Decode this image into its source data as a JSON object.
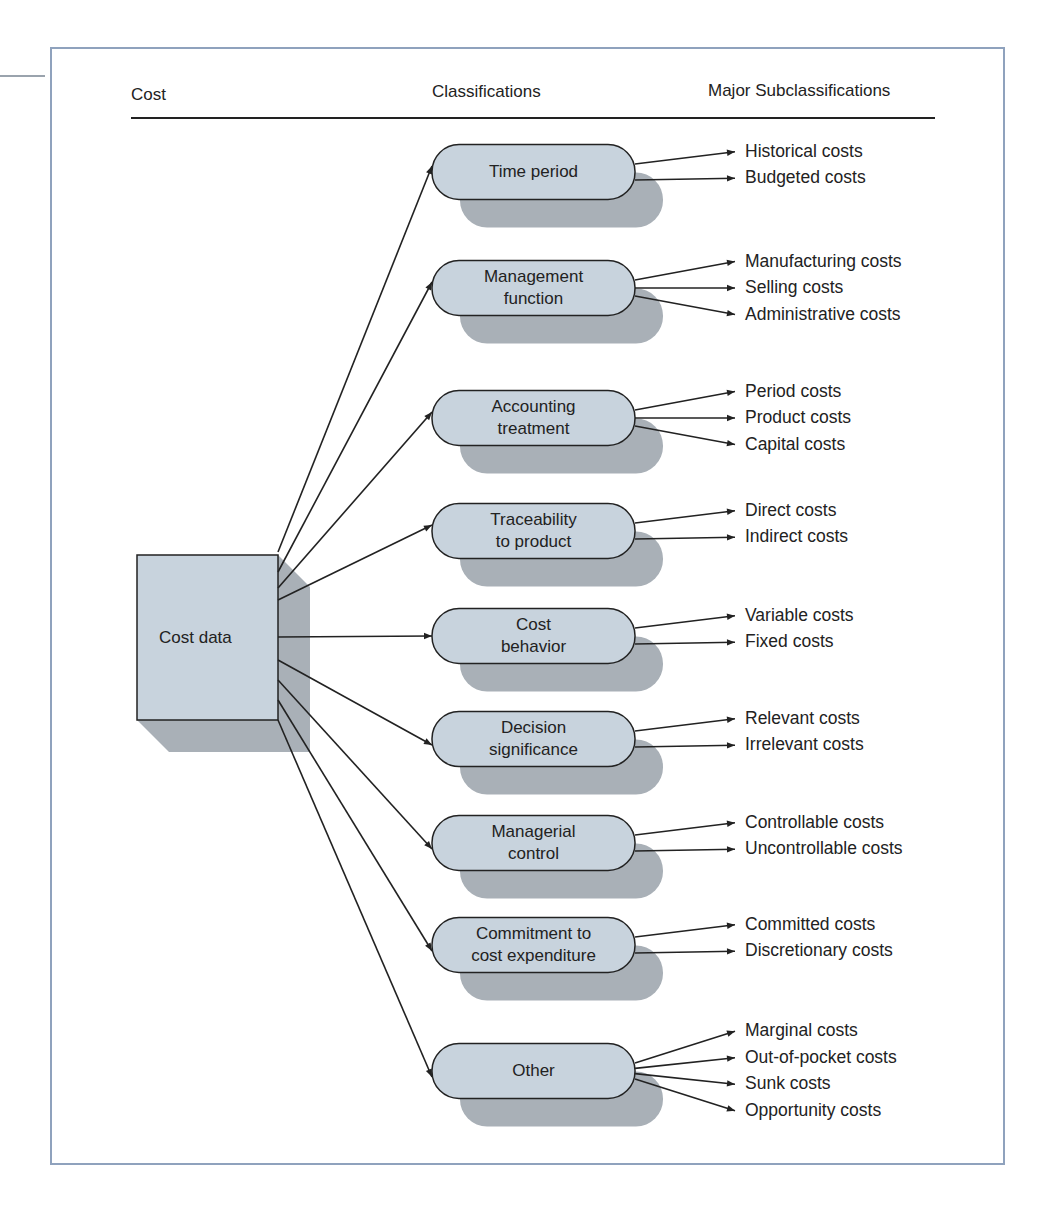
{
  "header": {
    "col_cost": "Cost",
    "col_classifications": "Classifications",
    "col_subclassifications": "Major Subclassifications"
  },
  "root": {
    "label": "Cost data"
  },
  "classifications": [
    {
      "label": "Time period",
      "subs": [
        "Historical costs",
        "Budgeted costs"
      ]
    },
    {
      "label": "Management function",
      "subs": [
        "Manufacturing costs",
        "Selling costs",
        "Administrative costs"
      ]
    },
    {
      "label": "Accounting treatment",
      "subs": [
        "Period costs",
        "Product costs",
        "Capital costs"
      ]
    },
    {
      "label": "Traceability to product",
      "subs": [
        "Direct costs",
        "Indirect costs"
      ]
    },
    {
      "label": "Cost behavior",
      "subs": [
        "Variable costs",
        "Fixed costs"
      ]
    },
    {
      "label": "Decision significance",
      "subs": [
        "Relevant costs",
        "Irrelevant costs"
      ]
    },
    {
      "label": "Managerial control",
      "subs": [
        "Controllable costs",
        "Uncontrollable costs"
      ]
    },
    {
      "label": "Commitment to cost expenditure",
      "subs": [
        "Committed costs",
        "Discretionary costs"
      ]
    },
    {
      "label": "Other",
      "subs": [
        "Marginal costs",
        "Out-of-pocket costs",
        "Sunk costs",
        "Opportunity costs"
      ]
    }
  ],
  "node_lines": [
    [
      "Time period"
    ],
    [
      "Management",
      "function"
    ],
    [
      "Accounting",
      "treatment"
    ],
    [
      "Traceability",
      "to product"
    ],
    [
      "Cost",
      "behavior"
    ],
    [
      "Decision",
      "significance"
    ],
    [
      "Managerial",
      "control"
    ],
    [
      "Commitment to",
      "cost expenditure"
    ],
    [
      "Other"
    ]
  ],
  "colors": {
    "node_fill": "#c8d3dd",
    "shadow_fill": "#a9b0b7",
    "frame_border": "#8fa2bd",
    "line": "#222222"
  }
}
